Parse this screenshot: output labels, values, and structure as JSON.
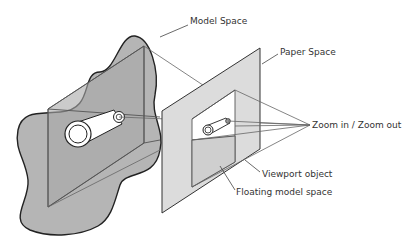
{
  "diagram": {
    "labels": {
      "model_space": "Model Space",
      "paper_space": "Paper Space",
      "zoom": "Zoom in / Zoom out",
      "viewport_object": "Viewport object",
      "floating_model_space": "Floating model space"
    },
    "colors": {
      "model_space_fill": "#b3b3b3",
      "model_box_fill": "#a9a9a9",
      "paper_fill": "#d9d9d9",
      "viewport_fill": "#ffffff",
      "line": "#555555",
      "outline": "#222222"
    }
  }
}
